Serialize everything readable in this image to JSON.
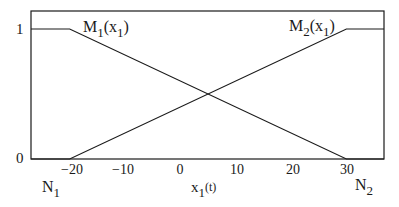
{
  "chart_data": {
    "type": "line",
    "title": "",
    "xlabel": "x_1(t)",
    "ylabel": "",
    "xlim": [
      -27,
      36.8
    ],
    "ylim": [
      0,
      1.14
    ],
    "grid": false,
    "x_ticks": [
      -20,
      -10,
      0,
      10,
      20,
      30
    ],
    "x_tick_labels": [
      "−20",
      "−10",
      "0",
      "10",
      "20",
      "30"
    ],
    "y_ticks": [
      0,
      1
    ],
    "y_tick_labels": [
      "0",
      "1"
    ],
    "series": [
      {
        "name": "M_1(x_1)",
        "label_main": "M",
        "label_sub": "1",
        "label_arg": "(x",
        "label_arg_sub": "1",
        "label_close": ")",
        "x": [
          -27,
          -20,
          30,
          36.8
        ],
        "values": [
          1,
          1,
          0,
          0
        ]
      },
      {
        "name": "M_2(x_1)",
        "label_main": "M",
        "label_sub": "2",
        "label_arg": "(x",
        "label_arg_sub": "1",
        "label_close": ")",
        "x": [
          -27,
          -20,
          30,
          36.8
        ],
        "values": [
          0,
          0,
          1,
          1
        ]
      }
    ],
    "annotations": [
      {
        "text": "N",
        "sub": "1",
        "x": -20,
        "position": "below-left"
      },
      {
        "text": "N",
        "sub": "2",
        "x": 30,
        "position": "below-right"
      }
    ]
  },
  "labels": {
    "xlabel_main": "x",
    "xlabel_sub": "1",
    "xlabel_arg": "(t)",
    "n1_main": "N",
    "n1_sub": "1",
    "n2_main": "N",
    "n2_sub": "2",
    "y0": "0",
    "y1": "1",
    "t_m20": "−20",
    "t_m10": "−10",
    "t_0": "0",
    "t_10": "10",
    "t_20": "20",
    "t_30": "30",
    "m1_main": "M",
    "m1_sub": "1",
    "m1_arg": "(x",
    "m1_arg_sub": "1",
    "m1_close": ")",
    "m2_main": "M",
    "m2_sub": "2",
    "m2_arg": "(x",
    "m2_arg_sub": "1",
    "m2_close": ")"
  },
  "colors": {
    "line": "#1a1a1a",
    "background": "#ffffff"
  }
}
